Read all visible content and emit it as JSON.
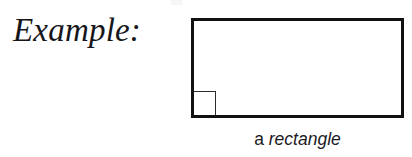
{
  "page": {
    "background_color": "#ffffff",
    "width": 412,
    "height": 157
  },
  "label": {
    "text": "Example:"
  },
  "figure": {
    "shape": "rectangle",
    "stroke_color": "#111114",
    "fill_color": "#ffffff",
    "right_angle_marker": {
      "present": true,
      "corner": "bottom-left",
      "stroke_color": "#2b2b30"
    }
  },
  "caption": {
    "article": "a ",
    "term": "rectangle",
    "full_text": "a rectangle"
  }
}
